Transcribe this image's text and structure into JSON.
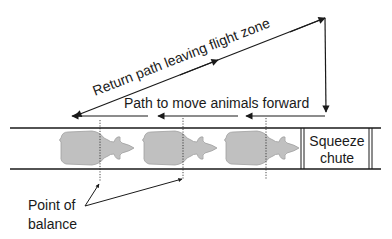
{
  "diagram": {
    "return_path_label": "Return path leaving flight zone",
    "forward_path_label": "Path to move animals forward",
    "squeeze_chute_line1": "Squeeze",
    "squeeze_chute_line2": "chute",
    "point_of_balance_line1": "Point of",
    "point_of_balance_line2": "balance",
    "animal_count": 3,
    "colors": {
      "line": "#1a1a1a",
      "animal_fill": "#bdbdbd",
      "animal_stroke": "#9a9a9a"
    }
  }
}
